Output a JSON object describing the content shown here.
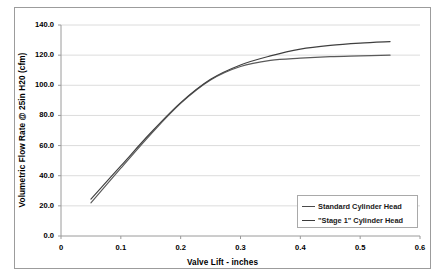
{
  "chart_data": {
    "type": "line",
    "title": "",
    "xlabel": "Valve Lift - inches",
    "ylabel": "Volumetric Flow Rate @ 25in H20 (cfm)",
    "xlim": [
      0,
      0.6
    ],
    "ylim": [
      0.0,
      140.0
    ],
    "xticks": [
      "0",
      "0.1",
      "0.2",
      "0.3",
      "0.4",
      "0.5",
      "0.6"
    ],
    "yticks": [
      "0.0",
      "20.0",
      "40.0",
      "60.0",
      "80.0",
      "100.0",
      "120.0",
      "140.0"
    ],
    "grid": true,
    "legend_position": "lower right",
    "series": [
      {
        "name": "Standard Cylinder Head",
        "color": "#5a5a5a",
        "x": [
          0.05,
          0.1,
          0.15,
          0.2,
          0.25,
          0.3,
          0.35,
          0.4,
          0.45,
          0.5,
          0.55
        ],
        "values": [
          22.0,
          45.0,
          67.5,
          88.0,
          103.5,
          112.5,
          116.5,
          118.0,
          119.0,
          119.5,
          120.0
        ]
      },
      {
        "name": "\"Stage 1\" Cylinder Head",
        "color": "#3f3f3f",
        "x": [
          0.05,
          0.1,
          0.15,
          0.2,
          0.25,
          0.3,
          0.35,
          0.4,
          0.45,
          0.5,
          0.55
        ],
        "values": [
          24.5,
          46.5,
          68.5,
          88.5,
          104.0,
          113.5,
          119.5,
          124.0,
          126.5,
          128.0,
          129.0
        ]
      }
    ]
  },
  "axis": {
    "y_title": "Volumetric Flow Rate @ 25in H20 (cfm)",
    "x_title": "Valve Lift - inches",
    "y_ticks": [
      "140.0",
      "120.0",
      "100.0",
      "80.0",
      "60.0",
      "40.0",
      "20.0",
      "0.0"
    ],
    "x_ticks": [
      "0",
      "0.1",
      "0.2",
      "0.3",
      "0.4",
      "0.5",
      "0.6"
    ]
  },
  "legend": {
    "entries": [
      {
        "label": "Standard Cylinder Head"
      },
      {
        "label": "\"Stage 1\" Cylinder Head"
      }
    ]
  }
}
